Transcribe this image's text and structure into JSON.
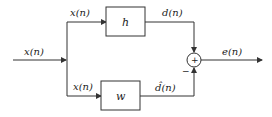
{
  "diagram": {
    "type": "block-diagram",
    "input_label": "x(n)",
    "branch_top_label": "x(n)",
    "branch_bottom_label": "x(n)",
    "blocks": [
      {
        "id": "h",
        "label": "h"
      },
      {
        "id": "w",
        "label": "w"
      }
    ],
    "top_output_label": "d(n)",
    "bottom_output_label": "d̂(n)",
    "sum_symbol": "+",
    "minus_sign": "−",
    "output_label": "e(n)",
    "colors": {
      "line": "#333333",
      "background": "#ffffff"
    }
  }
}
